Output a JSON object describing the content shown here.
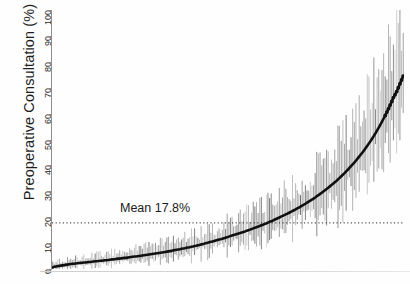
{
  "chart_data": {
    "type": "scatter",
    "title": "",
    "xlabel": "",
    "ylabel": "Preoperative Consultation (%)",
    "ylim": [
      0,
      100
    ],
    "ytick_values": [
      0,
      10,
      20,
      30,
      40,
      50,
      60,
      70,
      80,
      90,
      100
    ],
    "ytick_labels": [
      "0",
      "10",
      "20",
      "30",
      "40",
      "50",
      "60",
      "70",
      "80",
      "90",
      "100"
    ],
    "xlim": [
      0,
      232
    ],
    "xticks": [],
    "xtick_labels": [],
    "grid": false,
    "legend": null,
    "annotations": [
      {
        "text": "Mean 17.8%",
        "value": 17.8,
        "kind": "mean-reference-line",
        "line_style": "dotted"
      }
    ],
    "series": [
      {
        "name": "Hospital preoperative consultation rate (ranked)",
        "style": "caterpillar-plot: point estimate with vertical 95% CI bars, ordered ascending",
        "values": [
          0.6,
          0.9,
          1.0,
          1.1,
          1.2,
          1.3,
          1.4,
          1.5,
          1.6,
          1.7,
          1.8,
          1.9,
          2.0,
          2.0,
          2.1,
          2.2,
          2.3,
          2.3,
          2.4,
          2.5,
          2.5,
          2.6,
          2.7,
          2.7,
          2.8,
          2.9,
          3.0,
          3.0,
          3.1,
          3.2,
          3.2,
          3.3,
          3.4,
          3.4,
          3.5,
          3.6,
          3.7,
          3.7,
          3.8,
          3.9,
          4.0,
          4.0,
          4.1,
          4.2,
          4.3,
          4.3,
          4.4,
          4.5,
          4.6,
          4.7,
          4.8,
          4.8,
          4.9,
          5.0,
          5.1,
          5.2,
          5.3,
          5.4,
          5.5,
          5.6,
          5.7,
          5.8,
          5.9,
          6.0,
          6.1,
          6.2,
          6.3,
          6.4,
          6.5,
          6.6,
          6.7,
          6.8,
          6.9,
          7.0,
          7.2,
          7.3,
          7.4,
          7.5,
          7.6,
          7.8,
          7.9,
          8.0,
          8.2,
          8.3,
          8.4,
          8.6,
          8.7,
          8.9,
          9.0,
          9.2,
          9.3,
          9.5,
          9.6,
          9.8,
          10.0,
          10.1,
          10.3,
          10.5,
          10.6,
          10.8,
          11.0,
          11.2,
          11.4,
          11.5,
          11.7,
          11.9,
          12.1,
          12.3,
          12.5,
          12.7,
          12.9,
          13.1,
          13.3,
          13.5,
          13.7,
          13.9,
          14.1,
          14.3,
          14.5,
          14.8,
          15.0,
          15.2,
          15.4,
          15.7,
          15.9,
          16.1,
          16.4,
          16.6,
          16.9,
          17.1,
          17.4,
          17.6,
          17.9,
          18.2,
          18.4,
          18.7,
          19.0,
          19.3,
          19.6,
          19.9,
          20.2,
          20.5,
          20.8,
          21.1,
          21.4,
          21.7,
          22.0,
          22.4,
          22.7,
          23.0,
          23.4,
          23.7,
          24.1,
          24.5,
          24.8,
          25.2,
          25.6,
          26.0,
          26.4,
          26.8,
          27.2,
          27.6,
          28.1,
          28.5,
          29.0,
          29.4,
          29.9,
          30.4,
          30.9,
          31.4,
          31.9,
          32.4,
          32.9,
          33.5,
          34.0,
          34.6,
          35.2,
          35.8,
          36.4,
          37.0,
          37.7,
          38.3,
          39.0,
          39.7,
          40.4,
          41.1,
          41.8,
          42.6,
          43.4,
          44.2,
          45.0,
          45.8,
          46.7,
          47.6,
          48.5,
          49.4,
          50.4,
          51.4,
          52.4,
          53.5,
          54.6,
          55.7,
          56.9,
          58.1,
          59.3,
          60.6,
          61.9,
          63.3,
          64.7,
          66.2,
          67.3,
          68.5,
          70.0,
          71.5,
          73.0,
          74.5
        ]
      }
    ]
  },
  "axis": {
    "y_title": "Preoperative Consultation (%)"
  },
  "mean_line": {
    "label": "Mean 17.8%",
    "value": 17.8
  },
  "colors": {
    "line": "#101010",
    "error_bar": "#6e6e6e",
    "axis": "#8e8e8e",
    "text": "#1d1d1d",
    "background": "#ffffff"
  }
}
